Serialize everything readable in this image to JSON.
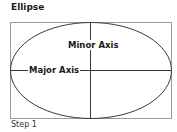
{
  "title": "Ellipse",
  "labels": {
    "minor_axis": "Minor Axis",
    "major_axis": "Major Axis"
  },
  "caption": "Step 1",
  "colors": {
    "stroke": "#3a3a3a",
    "frame": "#9a9a9a",
    "text": "#1a1a1a"
  }
}
